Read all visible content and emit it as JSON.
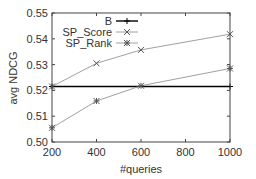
{
  "chart_data": {
    "type": "line",
    "title": "",
    "xlabel": "#queries",
    "ylabel": "avg NDCG",
    "x": [
      200,
      400,
      600,
      800,
      1000
    ],
    "x_ticks": [
      "200",
      "400",
      "600",
      "800",
      "1000"
    ],
    "y_ticks": [
      "0.50",
      "0.51",
      "0.52",
      "0.53",
      "0.54",
      "0.55"
    ],
    "xlim": [
      200,
      1000
    ],
    "ylim": [
      0.5,
      0.55
    ],
    "grid": false,
    "legend_position": "upper left (inside)",
    "series": [
      {
        "name": "B",
        "marker": "plus",
        "x": [
          200,
          1000
        ],
        "values": [
          0.5215,
          0.5215
        ],
        "color": "#000000",
        "linewidth": 1.4
      },
      {
        "name": "SP_Score",
        "marker": "x",
        "x": [
          200,
          400,
          600,
          1000
        ],
        "values": [
          0.5215,
          0.5305,
          0.5357,
          0.5418
        ],
        "color": "#888888",
        "linewidth": 0.8
      },
      {
        "name": "SP_Rank",
        "marker": "asterisk",
        "x": [
          200,
          400,
          600,
          1000
        ],
        "values": [
          0.5055,
          0.5159,
          0.5218,
          0.5285
        ],
        "color": "#888888",
        "linewidth": 0.8
      }
    ]
  }
}
